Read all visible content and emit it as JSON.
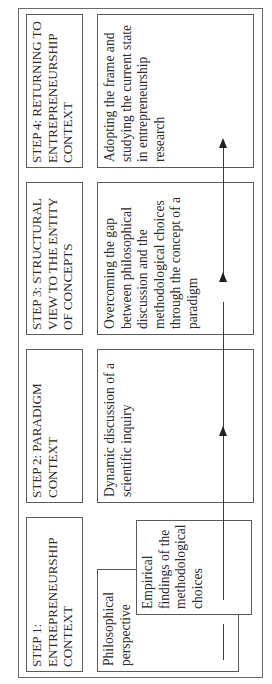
{
  "diagram": {
    "orientation": "rotated-90-counterclockwise",
    "steps": [
      {
        "id": "step1",
        "title": "STEP 1:\nENTREPRENEURSHIP\nCONTEXT",
        "content": [
          {
            "label": "Philosophical\nperspective"
          },
          {
            "label": "Empirical\nfindings of the\nmethodological\nchoices"
          }
        ]
      },
      {
        "id": "step2",
        "title": "STEP 2: PARADIGM\nCONTEXT",
        "content": [
          {
            "label": "Dynamic discussion of a\nscientific inquiry"
          }
        ]
      },
      {
        "id": "step3",
        "title": "STEP 3: STRUCTURAL\nVIEW TO THE ENTITY\nOF CONCEPTS",
        "content": [
          {
            "label": "Overcoming the gap\nbetween philosophical\ndiscussion and the\nmethodological choices\nthrough the concept of a\nparadigm"
          }
        ]
      },
      {
        "id": "step4",
        "title": "STEP 4: RETURNING TO\nENTREPRENEURSHIP\nCONTEXT",
        "content": [
          {
            "label": "Adopting the frame and\nstudying the current state\nin entrepreneurship\nresearch"
          }
        ]
      }
    ],
    "flow": {
      "direction": "step1 → step2 → step3 → step4",
      "connector": "arrow-line",
      "arrowheads": 3
    },
    "colors": {
      "border": "#5a5a5a",
      "text": "#2a2a2a",
      "arrow": "#1e1e1e",
      "background": "#ffffff"
    }
  }
}
